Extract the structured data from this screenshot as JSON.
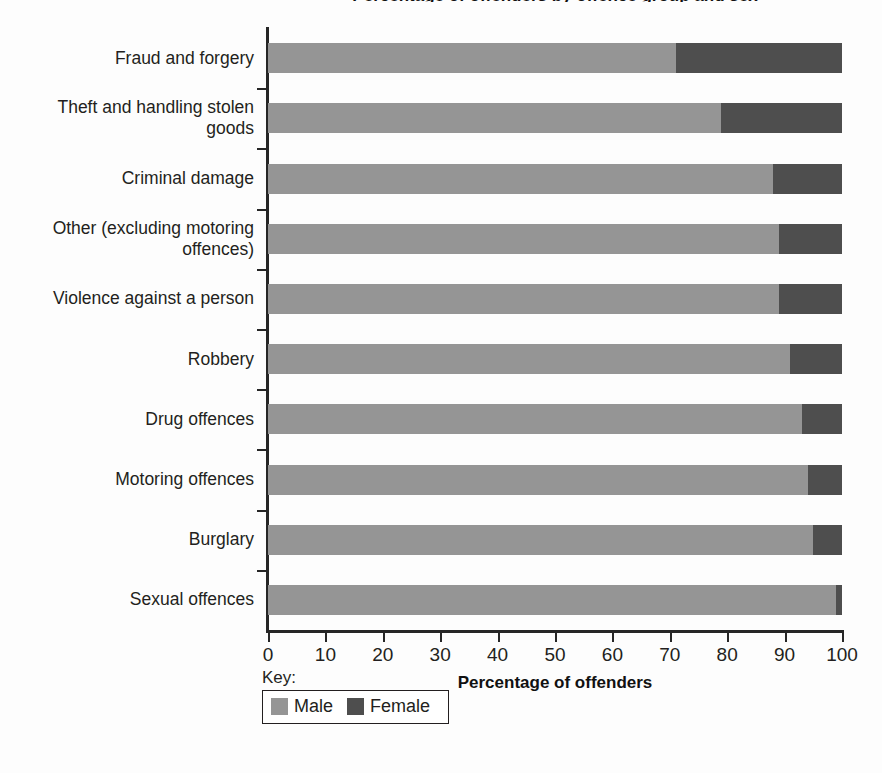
{
  "chart_data": {
    "type": "bar",
    "orientation": "horizontal",
    "stacked": true,
    "title": "Percentage of offenders by offence group and sex",
    "xlabel": "Percentage of offenders",
    "ylabel": "",
    "xlim": [
      0,
      100
    ],
    "xticks": [
      0,
      10,
      20,
      30,
      40,
      50,
      60,
      70,
      80,
      90,
      100
    ],
    "grid": false,
    "legend_position": "bottom-left",
    "legend_title": "Key:",
    "categories": [
      "Fraud and forgery",
      "Theft and handling stolen goods",
      "Criminal damage",
      "Other (excluding motoring offences)",
      "Violence against a person",
      "Robbery",
      "Drug offences",
      "Motoring offences",
      "Burglary",
      "Sexual offences"
    ],
    "series": [
      {
        "name": "Male",
        "color": "#959595",
        "values": [
          71,
          79,
          88,
          89,
          89,
          91,
          93,
          94,
          95,
          99
        ]
      },
      {
        "name": "Female",
        "color": "#4e4e4e",
        "values": [
          29,
          21,
          12,
          11,
          11,
          9,
          7,
          6,
          5,
          1
        ]
      }
    ]
  },
  "legend": {
    "title": "Key:",
    "entries": [
      {
        "label": "Male",
        "color": "#959595"
      },
      {
        "label": "Female",
        "color": "#4e4e4e"
      }
    ]
  },
  "axis": {
    "x_title": "Percentage of offenders",
    "tick_labels": [
      "0",
      "10",
      "20",
      "30",
      "40",
      "50",
      "60",
      "70",
      "80",
      "90",
      "100"
    ]
  }
}
